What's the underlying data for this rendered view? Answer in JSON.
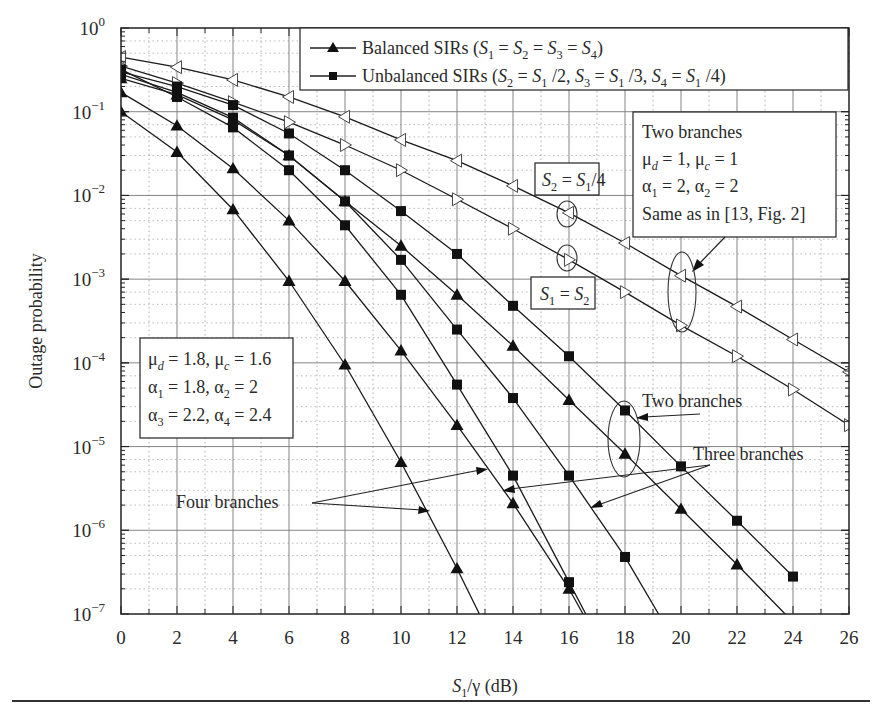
{
  "chart_data": {
    "type": "line",
    "title": "",
    "xlabel": "S1/γ (dB)",
    "ylabel": "Outage probability",
    "yscale": "log",
    "xlim": [
      0,
      26
    ],
    "ylim": [
      1e-07,
      1
    ],
    "grid": true,
    "x_ticks": [
      "0",
      "2",
      "4",
      "6",
      "8",
      "10",
      "12",
      "14",
      "16",
      "18",
      "20",
      "22",
      "24",
      "26"
    ],
    "y_ticks": [
      "10^0",
      "10^-1",
      "10^-2",
      "10^-3",
      "10^-4",
      "10^-5",
      "10^-6",
      "10^-7"
    ],
    "legend": {
      "position": "upper right",
      "entries": [
        {
          "marker": "triangle-filled",
          "label_main": "Balanced SIRs",
          "label_cond": "(S1 = S2 = S3 = S4)"
        },
        {
          "marker": "square-filled",
          "label_main": "Unbalanced SIRs",
          "label_cond": "(S2 = S1/2, S3 = S1/3, S4 = S1/4)"
        }
      ]
    },
    "series": [
      {
        "name": "Two branches, μd=1, μc=1, α1=α2=2, S2=S1/4",
        "marker": "triangle-left-open",
        "x": [
          0,
          2,
          4,
          6,
          8,
          10,
          12,
          14,
          16,
          18,
          20,
          22,
          24,
          26
        ],
        "values": [
          0.45,
          0.34,
          0.24,
          0.15,
          0.087,
          0.046,
          0.026,
          0.013,
          0.0062,
          0.0027,
          0.0011,
          0.00047,
          0.00019,
          7.8e-05
        ]
      },
      {
        "name": "Two branches, μd=1, μc=1, α1=α2=2, S1=S2",
        "marker": "triangle-right-open",
        "x": [
          0,
          2,
          4,
          6,
          8,
          10,
          12,
          14,
          16,
          18,
          20,
          22,
          24,
          26
        ],
        "values": [
          0.35,
          0.22,
          0.13,
          0.075,
          0.04,
          0.02,
          0.009,
          0.004,
          0.0017,
          0.0007,
          0.00028,
          0.00012,
          4.8e-05,
          1.8e-05
        ]
      },
      {
        "name": "Two branches, unbalanced",
        "marker": "square-filled",
        "x": [
          0,
          2,
          4,
          6,
          8,
          10,
          12,
          14,
          16,
          18,
          20,
          22,
          24
        ],
        "values": [
          0.3,
          0.2,
          0.12,
          0.055,
          0.02,
          0.0065,
          0.002,
          0.00048,
          0.00012,
          2.7e-05,
          5.8e-06,
          1.3e-06,
          2.8e-07
        ]
      },
      {
        "name": "Two branches, balanced",
        "marker": "triangle-filled",
        "x": [
          0,
          2,
          4,
          6,
          8,
          10,
          12,
          14,
          16,
          18,
          20,
          22,
          24
        ],
        "values": [
          0.25,
          0.16,
          0.08,
          0.03,
          0.0085,
          0.0025,
          0.00065,
          0.00016,
          3.6e-05,
          8.2e-06,
          1.8e-06,
          3.9e-07,
          8e-08
        ]
      },
      {
        "name": "Three branches, unbalanced",
        "marker": "square-filled",
        "x": [
          0,
          2,
          4,
          6,
          8,
          10,
          12,
          14,
          16,
          18,
          19.2
        ],
        "values": [
          0.28,
          0.17,
          0.085,
          0.03,
          0.0085,
          0.0017,
          0.00025,
          3.8e-05,
          4.5e-06,
          4.8e-07,
          1e-07
        ]
      },
      {
        "name": "Three branches, balanced",
        "marker": "triangle-filled",
        "x": [
          0,
          2,
          4,
          6,
          8,
          10,
          12,
          14,
          16,
          16.5
        ],
        "values": [
          0.17,
          0.068,
          0.021,
          0.005,
          0.00095,
          0.00014,
          1.8e-05,
          2.1e-06,
          2e-07,
          1e-07
        ]
      },
      {
        "name": "Four branches, unbalanced",
        "marker": "square-filled",
        "x": [
          0,
          2,
          4,
          6,
          8,
          10,
          12,
          14,
          16,
          16.6
        ],
        "values": [
          0.32,
          0.15,
          0.065,
          0.02,
          0.0044,
          0.00065,
          5.5e-05,
          4.5e-06,
          2.4e-07,
          1e-07
        ]
      },
      {
        "name": "Four branches, balanced",
        "marker": "triangle-filled",
        "x": [
          0,
          2,
          4,
          6,
          8,
          10,
          12,
          12.8
        ],
        "values": [
          0.1,
          0.033,
          0.0068,
          0.00095,
          9.5e-05,
          6.5e-06,
          3.5e-07,
          1e-07
        ]
      }
    ],
    "annotations": [
      {
        "text_lines": [
          "Two branches",
          "μd = 1, μc = 1",
          "α1 = 2, α2 = 2",
          "Same as in [13, Fig. 2]"
        ],
        "boxed": true
      },
      {
        "text_lines": [
          "μd = 1.8, μc = 1.6",
          "α1 = 1.8, α2 = 2",
          "α3 = 2.2, α4 = 2.4"
        ],
        "boxed": true
      },
      {
        "text": "S2 = S1/4",
        "boxed": true
      },
      {
        "text": "S1 = S2",
        "boxed": true
      },
      {
        "text": "Two branches",
        "boxed": false
      },
      {
        "text": "Three branches",
        "boxed": false
      },
      {
        "text": "Four branches",
        "boxed": false
      }
    ]
  },
  "labels": {
    "ylabel": "Outage probability",
    "xlabel_main": "S",
    "xlabel_sub": "1",
    "xlabel_rest": "/γ (dB)",
    "legend_balanced": "Balanced SIRs",
    "legend_unbalanced": "Unbalanced SIRs",
    "box1_l1": "Two branches",
    "box1_l4": "Same as in [13, Fig. 2]",
    "two_branches": "Two branches",
    "three_branches": "Three branches",
    "four_branches": "Four branches"
  }
}
